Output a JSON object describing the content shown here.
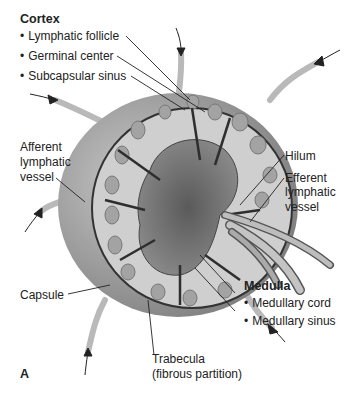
{
  "figure": {
    "panel_label": "A",
    "cortex": {
      "heading": "Cortex",
      "items": [
        "Lymphatic follicle",
        "Germinal center",
        "Subcapsular sinus"
      ]
    },
    "afferent": [
      "Afferent",
      "lymphatic",
      "vessel"
    ],
    "hilum": "Hilum",
    "efferent": [
      "Efferent",
      "lymphatic",
      "vessel"
    ],
    "medulla": {
      "heading": "Medulla",
      "items": [
        "Medullary cord",
        "Medullary sinus"
      ]
    },
    "capsule": "Capsule",
    "trabecula": [
      "Trabecula",
      "(fibrous partition)"
    ]
  },
  "colors": {
    "capsule_outer": "#8a8a8a",
    "capsule_inner": "#b5b5b5",
    "cortex_fill": "#d9d9d9",
    "follicle": "#a8a8a8",
    "medulla": "#6f6f6f",
    "trabecula": "#3a3a3a",
    "vessel": "#c8c8c8",
    "leader": "#222222"
  }
}
